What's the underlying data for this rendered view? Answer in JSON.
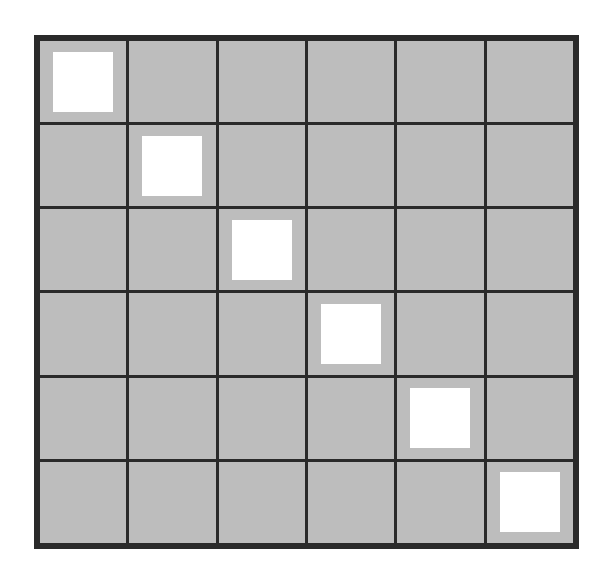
{
  "grid": {
    "rows": 6,
    "cols": 6,
    "cell_color": "#bdbdbd",
    "line_color": "#2a2a2a",
    "marker_color": "#ffffff",
    "markers": [
      [
        0,
        0
      ],
      [
        1,
        1
      ],
      [
        2,
        2
      ],
      [
        3,
        3
      ],
      [
        4,
        4
      ],
      [
        5,
        5
      ]
    ]
  }
}
